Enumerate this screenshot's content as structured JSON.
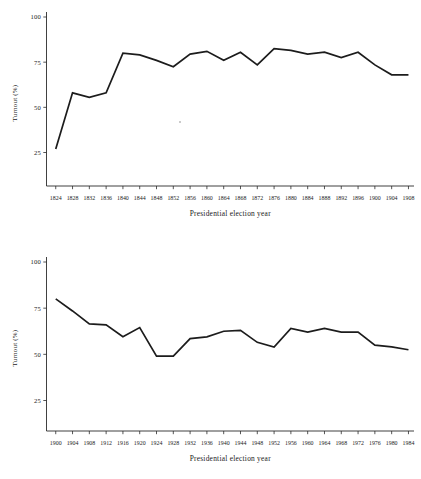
{
  "figures": [
    {
      "name": "turnout-1824-1908",
      "ylabel": "Turnout (%)",
      "xlabel": "Presidential election year"
    },
    {
      "name": "turnout-1900-1984",
      "ylabel": "Turnout (%)",
      "xlabel": "Presidential election year"
    }
  ],
  "chart_data": [
    {
      "type": "line",
      "title": "",
      "xlabel": "Presidential election year",
      "ylabel": "Turnout (%)",
      "ylim": [
        0,
        108
      ],
      "yticks": [
        25,
        50,
        75,
        100
      ],
      "ytick_labels": [
        "25",
        "50",
        "75",
        "100"
      ],
      "xlim": [
        1822,
        1910
      ],
      "grid": false,
      "legend": null,
      "categories": [
        1824,
        1828,
        1832,
        1836,
        1840,
        1844,
        1848,
        1852,
        1856,
        1860,
        1864,
        1868,
        1872,
        1876,
        1880,
        1884,
        1888,
        1892,
        1896,
        1900,
        1904,
        1908
      ],
      "xtick_labels": [
        "1824",
        "1828",
        "1832",
        "1836",
        "1840",
        "1844",
        "1848",
        "1852",
        "1856",
        "1860",
        "1864",
        "1868",
        "1872",
        "1876",
        "1880",
        "1884",
        "1888",
        "1892",
        "1896",
        "1900",
        "1904",
        "1908"
      ],
      "values": [
        27,
        58,
        55.5,
        58,
        80,
        79,
        76,
        72.5,
        79.5,
        81,
        76,
        80.5,
        73.5,
        82.5,
        81.5,
        79.5,
        80.5,
        77.5,
        80.5,
        73.5,
        68,
        68
      ]
    },
    {
      "type": "line",
      "title": "",
      "xlabel": "Presidential election year",
      "ylabel": "Turnout (%)",
      "ylim": [
        0,
        108
      ],
      "yticks": [
        25,
        50,
        75,
        100
      ],
      "ytick_labels": [
        "25",
        "50",
        "75",
        "100"
      ],
      "xlim": [
        1896,
        1986
      ],
      "grid": false,
      "legend": null,
      "categories": [
        1896,
        1900,
        1904,
        1908,
        1912,
        1916,
        1920,
        1924,
        1928,
        1932,
        1936,
        1940,
        1944,
        1948,
        1952,
        1956,
        1960,
        1964,
        1968,
        1972,
        1976,
        1980
      ],
      "xtick_labels": [
        "1900",
        "1904",
        "1908",
        "1912",
        "1916",
        "1920",
        "1924",
        "1928",
        "1932",
        "1936",
        "1940",
        "1944",
        "1948",
        "1952",
        "1956",
        "1960",
        "1964",
        "1968",
        "1972",
        "1976",
        "1980",
        "1984"
      ],
      "values": [
        80,
        73.5,
        66.5,
        66,
        59.5,
        64.5,
        49,
        49,
        58.5,
        59.5,
        62.5,
        63,
        56.5,
        54,
        64,
        62,
        64,
        62,
        62,
        55,
        54,
        52.5
      ]
    }
  ]
}
